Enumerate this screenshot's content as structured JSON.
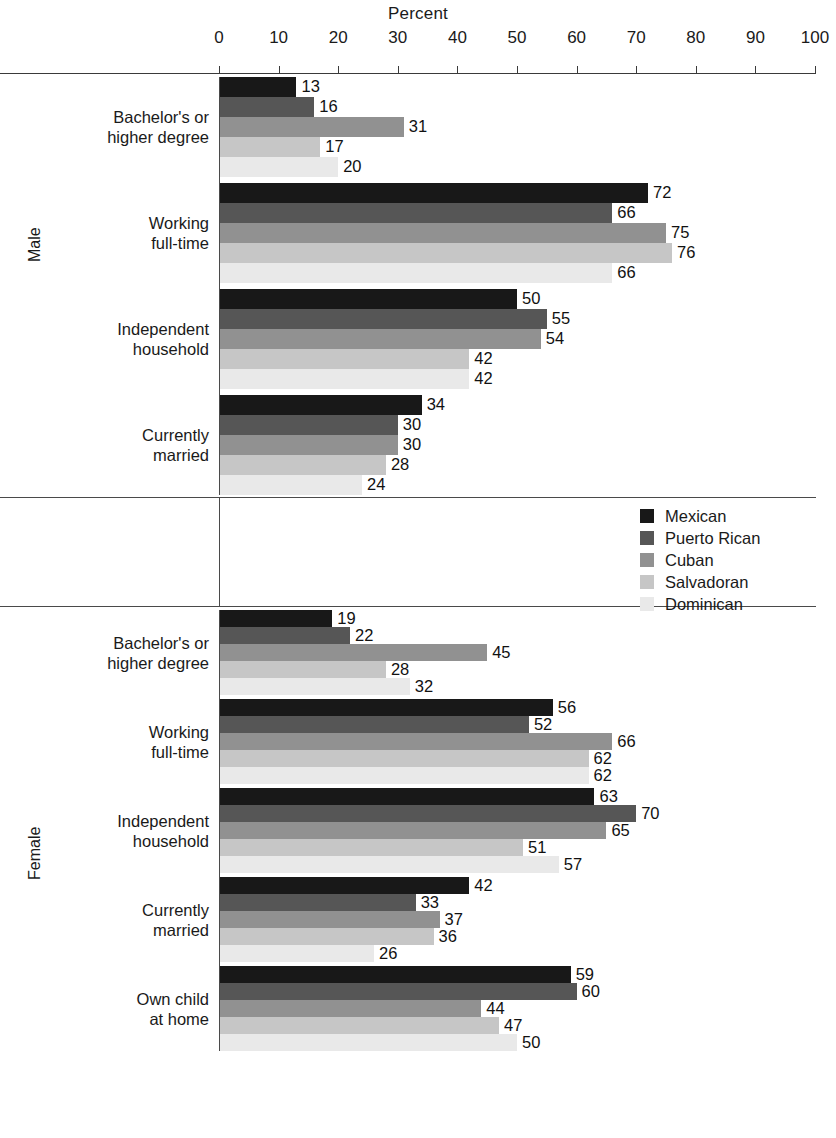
{
  "chart_data": {
    "type": "bar",
    "orientation": "horizontal",
    "title": "",
    "xlabel": "Percent",
    "ylabel": "",
    "xlim": [
      0,
      100
    ],
    "xticks": [
      0,
      10,
      20,
      30,
      40,
      50,
      60,
      70,
      80,
      90,
      100
    ],
    "grid": false,
    "legend_position": "middle-right",
    "series": [
      {
        "name": "Mexican",
        "color": "#181818"
      },
      {
        "name": "Puerto Rican",
        "color": "#565656"
      },
      {
        "name": "Cuban",
        "color": "#919191"
      },
      {
        "name": "Salvadoran",
        "color": "#c6c6c6"
      },
      {
        "name": "Dominican",
        "color": "#e9e9e9"
      }
    ],
    "panels": [
      {
        "label": "Male",
        "groups": [
          {
            "category": "Bachelor's or\nhigher degree",
            "values": [
              13,
              16,
              31,
              17,
              20
            ]
          },
          {
            "category": "Working\nfull-time",
            "values": [
              72,
              66,
              75,
              76,
              66
            ]
          },
          {
            "category": "Independent\nhousehold",
            "values": [
              50,
              55,
              54,
              42,
              42
            ]
          },
          {
            "category": "Currently\nmarried",
            "values": [
              34,
              30,
              30,
              28,
              24
            ]
          }
        ]
      },
      {
        "label": "Female",
        "groups": [
          {
            "category": "Bachelor's or\nhigher degree",
            "values": [
              19,
              22,
              45,
              28,
              32
            ]
          },
          {
            "category": "Working\nfull-time",
            "values": [
              56,
              52,
              66,
              62,
              62
            ]
          },
          {
            "category": "Independent\nhousehold",
            "values": [
              63,
              70,
              65,
              51,
              57
            ]
          },
          {
            "category": "Currently\nmarried",
            "values": [
              42,
              33,
              37,
              36,
              26
            ]
          },
          {
            "category": "Own child\nat home",
            "values": [
              59,
              60,
              44,
              47,
              50
            ]
          }
        ]
      }
    ]
  },
  "axis": {
    "title": "Percent",
    "ticks": [
      "0",
      "10",
      "20",
      "30",
      "40",
      "50",
      "60",
      "70",
      "80",
      "90",
      "100"
    ]
  },
  "legend": {
    "items": [
      {
        "label": "Mexican",
        "color": "#181818"
      },
      {
        "label": "Puerto Rican",
        "color": "#565656"
      },
      {
        "label": "Cuban",
        "color": "#919191"
      },
      {
        "label": "Salvadoran",
        "color": "#c6c6c6"
      },
      {
        "label": "Dominican",
        "color": "#e9e9e9"
      }
    ]
  },
  "panels": {
    "male_label": "Male",
    "female_label": "Female"
  }
}
